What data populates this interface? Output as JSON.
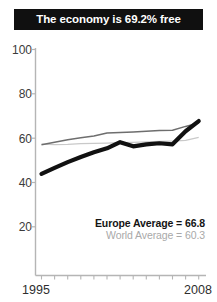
{
  "title": {
    "text": "The economy is 69.2% free"
  },
  "legend": {
    "country_label": "Europe Average = 66.8",
    "world_label": "World Average = 60.3"
  },
  "colors": {
    "banner_background": "#101010",
    "banner_text": "#ffffff",
    "country_line": "#111111",
    "europe_line": "#6e6e6e",
    "world_line": "#c9c9c9",
    "axis": "#b5b5b5",
    "tick_label": "#3b3b3b"
  },
  "chart_data": {
    "type": "line",
    "title": "The economy is 69.2% free",
    "xlabel": "",
    "ylabel": "",
    "xlim": [
      1995,
      2008
    ],
    "ylim": [
      0,
      100
    ],
    "yticks": [
      20,
      40,
      60,
      80,
      100
    ],
    "ytick_labels": [
      "20",
      "40",
      "60",
      "80",
      "100"
    ],
    "xtick_labels": [
      "1995",
      "2008"
    ],
    "x": [
      1996,
      1997,
      1998,
      1999,
      2000,
      2001,
      2002,
      2003,
      2004,
      2005,
      2006,
      2007,
      2008
    ],
    "grid": false,
    "legend_position": "inside-lower-right",
    "series": [
      {
        "name": "Country",
        "style": "thick-black",
        "values": [
          43.9,
          46.6,
          49.2,
          51.5,
          53.6,
          55.4,
          58.2,
          56.3,
          57.2,
          57.7,
          57.2,
          63.1,
          67.7
        ]
      },
      {
        "name": "Europe Average",
        "style": "thin-gray",
        "values": [
          57.0,
          58.1,
          59.3,
          60.2,
          61.0,
          62.3,
          62.6,
          62.8,
          63.1,
          63.4,
          63.6,
          65.3,
          66.8
        ]
      },
      {
        "name": "World Average",
        "style": "thin-light-gray",
        "values": [
          57.3,
          57.1,
          57.2,
          57.5,
          57.6,
          57.8,
          58.0,
          58.1,
          58.3,
          58.5,
          58.7,
          59.0,
          60.3
        ]
      }
    ]
  }
}
